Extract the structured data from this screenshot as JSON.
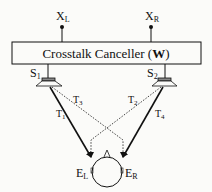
{
  "diagram": {
    "title": "Crosstalk Canceller",
    "title_bold_part": "W",
    "inputs": {
      "left": {
        "main": "X",
        "sub": "L"
      },
      "right": {
        "main": "X",
        "sub": "R"
      }
    },
    "speakers": {
      "left": {
        "main": "S",
        "sub": "1"
      },
      "right": {
        "main": "S",
        "sub": "2"
      }
    },
    "paths": [
      {
        "main": "T",
        "sub": "1",
        "style": "solid",
        "from": "S1",
        "to": "EL"
      },
      {
        "main": "T",
        "sub": "2",
        "style": "dotted",
        "from": "S2",
        "to": "EL"
      },
      {
        "main": "T",
        "sub": "3",
        "style": "dotted",
        "from": "S1",
        "to": "ER"
      },
      {
        "main": "T",
        "sub": "4",
        "style": "solid",
        "from": "S2",
        "to": "ER"
      }
    ],
    "ears": {
      "left": {
        "main": "E",
        "sub": "L"
      },
      "right": {
        "main": "E",
        "sub": "R"
      }
    },
    "colors": {
      "ink": "#111111",
      "background": "#fbfbf9",
      "speaker_fill": "#888888"
    }
  }
}
